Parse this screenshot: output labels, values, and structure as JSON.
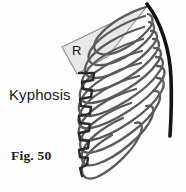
{
  "figure": {
    "caption": "Fig. 50",
    "condition_label": "Kyphosis",
    "wedge_label": "R",
    "background_color": "#fdfdfd",
    "colors": {
      "spine_stroke": "#141414",
      "rib_stroke": "#5a5a5a",
      "vertebra_stroke": "#2b2b2b",
      "wedge_fill": "#e8e8e8",
      "wedge_stroke": "#8c8c8c",
      "text_color": "#1a1a1a"
    },
    "elements": {
      "spine_name": "kyphotic-spine-curve",
      "rib_cage_name": "rib-cage",
      "vertebral_column_name": "vertebral-column",
      "wedge_name": "rib-hump-measurement-wedge",
      "rib_count": 11
    }
  }
}
